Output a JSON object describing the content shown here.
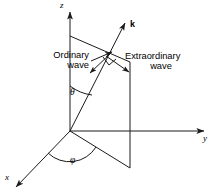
{
  "figure": {
    "stroke_color": "#1a1a1a",
    "background_color": "#ffffff",
    "axes": [
      {
        "id": "z",
        "label": "z",
        "direction": "up"
      },
      {
        "id": "y",
        "label": "y",
        "direction": "right"
      },
      {
        "id": "x",
        "label": "x",
        "direction": "down-left"
      }
    ],
    "vectors": [
      {
        "id": "k",
        "label": "k",
        "bold": true,
        "description": "wave vector"
      }
    ],
    "angles": [
      {
        "id": "theta",
        "label": "θ",
        "between": "z-axis and k vector"
      },
      {
        "id": "phi",
        "label": "φ",
        "between": "x-axis and projection of k on xy-plane"
      }
    ],
    "waves": [
      {
        "id": "ordinary",
        "line1": "Ordinary",
        "line2": "wave"
      },
      {
        "id": "extraordinary",
        "line1": "Extraordinary",
        "line2": "wave"
      }
    ],
    "markers": [
      {
        "id": "right-angle",
        "description": "right angle between ordinary and extraordinary polarization directions"
      }
    ]
  }
}
